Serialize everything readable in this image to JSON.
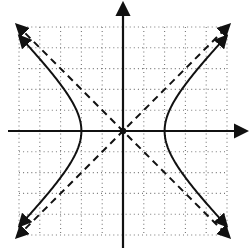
{
  "chart_data": {
    "type": "line",
    "title": "",
    "xlabel": "",
    "ylabel": "",
    "xlim": [
      -5,
      5
    ],
    "ylim": [
      -5,
      5
    ],
    "grid": true,
    "grid_style": "dotted",
    "grid_minor_subdivisions": 2,
    "axes_arrows": true,
    "origin_marker": true,
    "series": [
      {
        "name": "hyperbola",
        "equation": "x^2/4 - y^2/4 = 1",
        "style": "solid",
        "branches": [
          "left",
          "right"
        ],
        "vertices": [
          [
            -2,
            0
          ],
          [
            2,
            0
          ]
        ],
        "arrows": true
      },
      {
        "name": "asymptote-positive",
        "equation": "y = x",
        "style": "dashed",
        "arrows": true
      },
      {
        "name": "asymptote-negative",
        "equation": "y = -x",
        "style": "dashed",
        "arrows": true
      }
    ],
    "legend": null
  },
  "colors": {
    "ink": "#111111",
    "grid": "#777777",
    "background": "#ffffff"
  }
}
